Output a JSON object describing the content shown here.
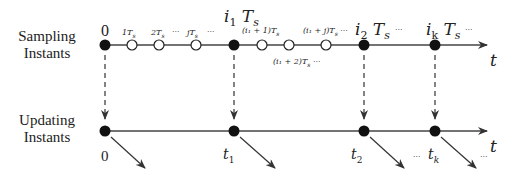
{
  "rows": {
    "sampling": {
      "label_line1": "Sampling",
      "label_line2": "Instants"
    },
    "updating": {
      "label_line1": "Updating",
      "label_line2": "Instants"
    }
  },
  "axis_label": "t",
  "sampling_ticks": {
    "zero": "0",
    "t1": "1T",
    "t1_sub": "s",
    "t2": "2T",
    "t2_sub": "s",
    "ell1": "···",
    "tj": "jT",
    "tj_sub": "s",
    "ell2": "···",
    "i1": "i",
    "i1_sub": "1",
    "i1_T": "T",
    "i1_Tsub": "s",
    "i1p1": "(i₁ + 1)T",
    "i1p1_sub": "s",
    "i1p2": "(i₁ + 2)T",
    "i1p2_sub": "s",
    "i1p2_ell": "···",
    "i1pj": "(i₁ + j)T",
    "i1pj_sub": "s",
    "i1pj_ell": "···",
    "i2": "i",
    "i2_sub": "2",
    "i2_T": "T",
    "i2_Tsub": "s",
    "ell3": "···",
    "ik": "i",
    "ik_sub": "k",
    "ik_T": "T",
    "ik_Tsub": "s",
    "ell4": "···"
  },
  "updating_ticks": {
    "zero": "0",
    "t1": "t",
    "t1_sub": "1",
    "t2": "t",
    "t2_sub": "2",
    "ell1": "···",
    "tk": "t",
    "tk_sub": "k",
    "ell2": "···"
  },
  "colors": {
    "line": "#333333",
    "dot": "#111111",
    "open_dot_fill": "#ffffff"
  }
}
